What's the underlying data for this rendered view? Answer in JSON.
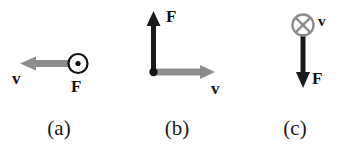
{
  "figure": {
    "background_color": "#ffffff",
    "vector_colors": {
      "velocity": "#8d8d8d",
      "force": "#1a1a1a"
    },
    "panels": [
      {
        "caption": "(a)",
        "velocity": {
          "label": "v",
          "direction": "left",
          "color": "#8d8d8d"
        },
        "force": {
          "label": "F",
          "direction": "out-of-page",
          "symbol": "circle-dot",
          "color": "#1a1a1a"
        }
      },
      {
        "caption": "(b)",
        "velocity": {
          "label": "v",
          "direction": "right",
          "color": "#8d8d8d"
        },
        "force": {
          "label": "F",
          "direction": "up",
          "color": "#1a1a1a"
        },
        "origin_marker": "filled-dot"
      },
      {
        "caption": "(c)",
        "velocity": {
          "label": "v",
          "direction": "into-page",
          "symbol": "circle-cross",
          "color": "#8d8d8d"
        },
        "force": {
          "label": "F",
          "direction": "down",
          "color": "#1a1a1a"
        }
      }
    ]
  }
}
